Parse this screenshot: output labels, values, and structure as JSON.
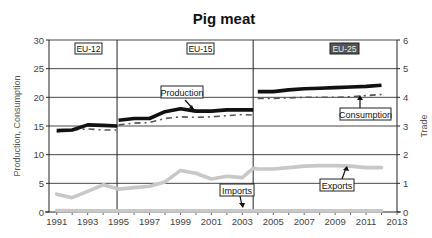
{
  "chart_data": {
    "type": "line",
    "title": "Pig meat",
    "ylabel": "Production, Consumption",
    "y2label": "Trade",
    "xlabel": "",
    "xlim": [
      1990.5,
      2013
    ],
    "ylim": [
      0,
      30
    ],
    "y2lim": [
      0,
      6
    ],
    "grid": true,
    "x_ticks": [
      1991,
      1993,
      1995,
      1997,
      1999,
      2001,
      2003,
      2005,
      2007,
      2009,
      2011,
      2013
    ],
    "y_ticks": [
      0,
      5,
      10,
      15,
      20,
      25,
      30
    ],
    "y2_ticks": [
      0,
      1,
      2,
      3,
      4,
      5,
      6
    ],
    "regions": [
      {
        "label": "EU-12",
        "from": 1990.5,
        "to": 1994.9
      },
      {
        "label": "EU-15",
        "from": 1994.9,
        "to": 2003.7
      },
      {
        "label": "EU-25",
        "from": 2003.7,
        "to": 2013
      }
    ],
    "series": [
      {
        "name": "Production",
        "axis": "left",
        "style": "thick-black",
        "segments": [
          {
            "x": [
              1991,
              1992,
              1993,
              1994,
              1994.9
            ],
            "values": [
              14.2,
              14.3,
              15.2,
              15.1,
              15.0
            ]
          },
          {
            "x": [
              1995,
              1996,
              1997,
              1998,
              1999,
              2000,
              2001,
              2002,
              2003,
              2003.7
            ],
            "values": [
              16.0,
              16.3,
              16.3,
              17.5,
              18.0,
              17.6,
              17.6,
              17.8,
              17.8,
              17.8
            ]
          },
          {
            "x": [
              2004,
              2005,
              2006,
              2007,
              2008,
              2009,
              2010,
              2011,
              2012
            ],
            "values": [
              21.0,
              21.0,
              21.3,
              21.5,
              21.6,
              21.7,
              21.8,
              21.9,
              22.1
            ]
          }
        ]
      },
      {
        "name": "Consumption",
        "axis": "left",
        "style": "dashed-dark",
        "segments": [
          {
            "x": [
              1991,
              1992,
              1993,
              1994,
              1994.9
            ],
            "values": [
              14.0,
              14.3,
              14.5,
              14.3,
              14.3
            ]
          },
          {
            "x": [
              1995,
              1996,
              1997,
              1998,
              1999,
              2000,
              2001,
              2002,
              2003,
              2003.7
            ],
            "values": [
              15.2,
              15.5,
              15.6,
              16.3,
              16.6,
              16.5,
              16.6,
              16.8,
              17.0,
              16.9
            ]
          },
          {
            "x": [
              2004,
              2005,
              2006,
              2007,
              2008,
              2009,
              2010,
              2011,
              2012
            ],
            "values": [
              19.8,
              19.8,
              19.9,
              20.0,
              20.0,
              20.0,
              20.1,
              20.3,
              20.5
            ]
          }
        ]
      },
      {
        "name": "Exports",
        "axis": "right",
        "style": "thick-lightgray",
        "segments": [
          {
            "x": [
              1991,
              1992,
              1993,
              1994,
              1995,
              1996,
              1997,
              1998,
              1999,
              2000,
              2001,
              2002,
              2003,
              2003.7,
              2004,
              2005,
              2006,
              2007,
              2008,
              2009,
              2010,
              2011,
              2012
            ],
            "values": [
              0.62,
              0.5,
              0.72,
              0.95,
              0.8,
              0.85,
              0.9,
              1.05,
              1.45,
              1.35,
              1.15,
              1.25,
              1.2,
              1.52,
              1.5,
              1.5,
              1.55,
              1.6,
              1.62,
              1.62,
              1.6,
              1.55,
              1.55
            ]
          }
        ]
      },
      {
        "name": "Imports",
        "axis": "right",
        "style": "thick-lightgray",
        "segments": [
          {
            "x": [
              1991,
              1993,
              1995,
              1997,
              1999,
              2001,
              2003,
              2005,
              2007,
              2009,
              2011,
              2012
            ],
            "values": [
              0.05,
              0.04,
              0.04,
              0.04,
              0.04,
              0.04,
              0.04,
              0.04,
              0.04,
              0.04,
              0.04,
              0.04
            ]
          }
        ]
      }
    ],
    "annotations": [
      {
        "text": "Production",
        "points_to": "Production",
        "at_x": 1999.5
      },
      {
        "text": "Consumption",
        "points_to": "Consumption",
        "at_x": 2010.5
      },
      {
        "text": "Exports",
        "points_to": "Exports",
        "at_x": 2009.5
      },
      {
        "text": "Imports",
        "points_to": "Imports",
        "at_x": 2003
      }
    ],
    "legend": "none (inline callouts)"
  },
  "labels": {
    "title": "Pig meat",
    "ylabel": "Production, Consumption",
    "y2label": "Trade",
    "region_eu12": "EU-12",
    "region_eu15": "EU-15",
    "region_eu25": "EU-25",
    "callout_production": "Production",
    "callout_consumption": "Consumption",
    "callout_exports": "Exports",
    "callout_imports": "Imports"
  },
  "colors": {
    "production": "#111111",
    "consumption": "#555555",
    "trade": "#c8c8c8",
    "grid": "#333333",
    "region_badge_eu25": "#555555"
  }
}
